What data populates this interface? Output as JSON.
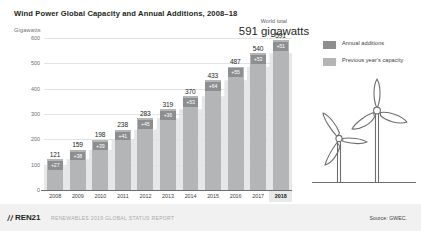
{
  "header": {
    "title": "Wind Power Global Capacity and Annual Additions, 2008–18",
    "axis_unit": "Gigawatts"
  },
  "callout": {
    "label": "World total",
    "value": "591 gigawatts"
  },
  "legend": {
    "items": [
      {
        "label": "Annual additions",
        "color": "#8c8e90",
        "name": "annual-additions"
      },
      {
        "label": "Previous year's capacity",
        "color": "#b3b5b7",
        "name": "previous-years-capacity"
      }
    ]
  },
  "footer": {
    "logo": "REN21",
    "report": "RENEWABLES 2019 GLOBAL STATUS REPORT",
    "source": "Source: GWEC."
  },
  "colors": {
    "bar": "#b3b5b7",
    "addition_box": "#8c8e90",
    "area": "#e6e7e8",
    "grid": "#e2e3e4",
    "axis": "#6d6e71",
    "text": "#231f20",
    "footer_bg": "#f1f1f2",
    "highlight": "#e8e9ea"
  },
  "chart_data": {
    "type": "bar",
    "title": "Wind Power Global Capacity and Annual Additions, 2008–18",
    "xlabel": "",
    "ylabel": "Gigawatts",
    "ylim": [
      0,
      600
    ],
    "yticks": [
      0,
      100,
      200,
      300,
      400,
      500,
      600
    ],
    "ytick_labels": [
      "0",
      "100",
      "200",
      "300",
      "400",
      "500",
      "600"
    ],
    "grid": true,
    "legend_position": "right",
    "categories": [
      "2008",
      "2009",
      "2010",
      "2011",
      "2012",
      "2013",
      "2014",
      "2015",
      "2016",
      "2017",
      "2018"
    ],
    "total_labels": [
      "121",
      "159",
      "198",
      "238",
      "283",
      "319",
      "370",
      "433",
      "487",
      "540",
      "591"
    ],
    "addition_labels": [
      "+27",
      "+38",
      "+39",
      "+41",
      "+45",
      "+36",
      "+53",
      "+64",
      "+55",
      "+53",
      "+51"
    ],
    "series": [
      {
        "name": "Previous year's capacity",
        "values": [
          94,
          121,
          159,
          198,
          238,
          283,
          319,
          370,
          433,
          487,
          540
        ]
      },
      {
        "name": "Annual additions",
        "values": [
          27,
          38,
          39,
          41,
          45,
          36,
          53,
          64,
          55,
          53,
          51
        ]
      }
    ],
    "totals": [
      121,
      159,
      198,
      238,
      283,
      319,
      370,
      433,
      487,
      540,
      591
    ],
    "annotation": "World total 591 gigawatts",
    "source": "Source: GWEC."
  }
}
